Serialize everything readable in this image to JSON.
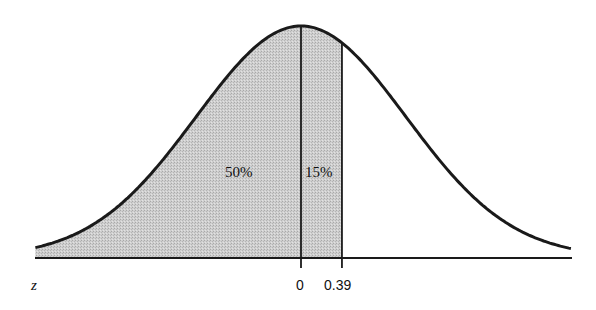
{
  "chart_data": {
    "type": "area",
    "title": "",
    "xlabel": "z",
    "ylabel": "",
    "distribution": "standard normal",
    "x_ticks": [
      {
        "value": 0,
        "label": "0"
      },
      {
        "value": 0.39,
        "label": "0.39"
      }
    ],
    "xlim": [
      -2.53,
      2.58
    ],
    "shaded_regions": [
      {
        "from": "-inf",
        "to": 0,
        "label": "50%",
        "percent": 50
      },
      {
        "from": 0,
        "to": 0.39,
        "label": "15%",
        "percent": 15
      }
    ],
    "vertical_lines": [
      0,
      0.39
    ],
    "grid": false,
    "legend": null
  },
  "labels": {
    "axis_variable": "z",
    "tick_zero": "0",
    "tick_039": "0.39",
    "region_left": "50%",
    "region_middle": "15%"
  },
  "colors": {
    "curve": "#1a1a1a",
    "shade": "#c9c9c9",
    "background": "#ffffff"
  }
}
